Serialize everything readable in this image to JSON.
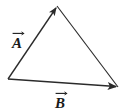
{
  "figure": {
    "type": "vector-diagram",
    "background_color": "#ffffff",
    "stroke_color": "#2b2b2b",
    "label_color": "#1a1a1a",
    "width": 124,
    "height": 111,
    "labels": [
      {
        "id": "A",
        "text": "A",
        "name": "vector-label-a",
        "overarrow": true,
        "x": 12,
        "y": 36
      },
      {
        "id": "B",
        "text": "B",
        "name": "vector-label-b",
        "overarrow": true,
        "x": 55,
        "y": 96
      }
    ],
    "vertices": {
      "left": [
        8,
        79
      ],
      "apex": [
        57,
        6
      ],
      "right": [
        118,
        87
      ]
    },
    "edges": [
      {
        "id": "A",
        "name": "vector-a-arrow",
        "from": [
          8,
          79
        ],
        "to": [
          57,
          6
        ],
        "arrowhead": "end",
        "label": "A"
      },
      {
        "id": "B",
        "name": "vector-b-arrow",
        "from": [
          8,
          79
        ],
        "to": [
          118,
          87
        ],
        "arrowhead": "end",
        "label": "B"
      },
      {
        "id": "C",
        "name": "closing-side-line",
        "from": [
          57,
          6
        ],
        "to": [
          118,
          87
        ],
        "arrowhead": "none",
        "label": ""
      }
    ]
  }
}
